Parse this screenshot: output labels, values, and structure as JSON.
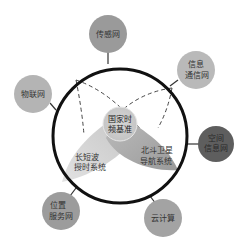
{
  "diagram": {
    "type": "hub-and-spoke concept diagram",
    "center": {
      "label_lines": [
        "国家时",
        "频基准"
      ],
      "fill": "#c8c8c8"
    },
    "inner_systems": [
      {
        "id": "long-short-wave",
        "label_lines": [
          "长短波",
          "授时系统"
        ],
        "fill": "#cfcfcf"
      },
      {
        "id": "beidou",
        "label_lines": [
          "北斗卫星",
          "导航系统"
        ],
        "fill": "#a9a9a9"
      }
    ],
    "outer_nodes": [
      {
        "id": "sensor-network",
        "label_lines": [
          "传感网"
        ],
        "fill": "#9a9a9a"
      },
      {
        "id": "info-comm-network",
        "label_lines": [
          "信息",
          "通信网"
        ],
        "fill": "#b9b9b9"
      },
      {
        "id": "iot",
        "label_lines": [
          "物联网"
        ],
        "fill": "#b4b4b4"
      },
      {
        "id": "spatial-info-network",
        "label_lines": [
          "空间",
          "信息网"
        ],
        "fill": "#5e5e5e"
      },
      {
        "id": "location-service-network",
        "label_lines": [
          "位置",
          "服务网"
        ],
        "fill": "#9c9c9c"
      },
      {
        "id": "cloud-computing",
        "label_lines": [
          "云计算"
        ],
        "fill": "#a3a3a3"
      }
    ],
    "ring": {
      "stroke": "#111111",
      "stroke_width": 3
    },
    "connector_color": "#333333",
    "dashed_arc_color": "#444444"
  }
}
